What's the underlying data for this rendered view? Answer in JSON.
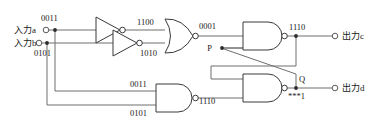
{
  "diagram": {
    "colors": {
      "wire": "#6e6e6e",
      "gate_stroke": "#3a3a3a",
      "background": "#ffffff",
      "text": "#1a1a1a"
    }
  },
  "inputs": [
    {
      "label": "入力a",
      "value": "0011",
      "terminal": "input-terminal-a"
    },
    {
      "label": "入力b",
      "value": "0101",
      "terminal": "input-terminal-b"
    }
  ],
  "outputs": [
    {
      "label": "出力c",
      "terminal": "output-terminal-c"
    },
    {
      "label": "出力d",
      "terminal": "output-terminal-d"
    }
  ],
  "gates": [
    {
      "id": "not-gate-top",
      "type": "NOT",
      "output_value": "1100"
    },
    {
      "id": "not-gate-bottom",
      "type": "NOT",
      "output_value": "1010"
    },
    {
      "id": "nor-gate",
      "type": "NOR",
      "output_value": "0001"
    },
    {
      "id": "nand-gate-top",
      "type": "NAND",
      "output_value": "1110"
    },
    {
      "id": "nand-gate-bottom-left",
      "type": "NAND",
      "output_value": "1110",
      "input_values": [
        "0011",
        "0101"
      ]
    },
    {
      "id": "nand-gate-bottom-right",
      "type": "NAND",
      "output_value": "***1"
    }
  ],
  "node_labels": [
    {
      "id": "node-label-p",
      "text": "P"
    },
    {
      "id": "node-label-q",
      "text": "Q"
    }
  ],
  "signal_labels": {
    "not_top_out": "1100",
    "not_bottom_out": "1010",
    "nor_out": "0001",
    "nand_top_out": "1110",
    "nand_bl_in_top": "0011",
    "nand_bl_in_bottom": "0101",
    "nand_bl_out": "1110",
    "nand_br_out": "***1"
  }
}
